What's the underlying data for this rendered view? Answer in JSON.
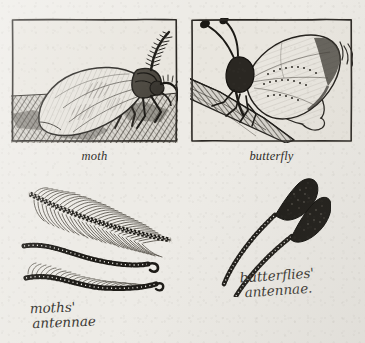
{
  "page": {
    "kind": "natural-history-plate",
    "paper_color": "#edebe6",
    "ink_color": "#2b2824"
  },
  "plates": [
    {
      "id": "moth",
      "caption": "moth",
      "scene": "moth resting on ground with folded wings and feathery antennae",
      "frame": {
        "x": 11,
        "y": 18,
        "width": 167,
        "height": 125
      }
    },
    {
      "id": "butterfly",
      "caption": "butterfly",
      "scene": "butterfly perched on a branch with wings raised and clubbed antennae",
      "frame": {
        "x": 190,
        "y": 18,
        "width": 163,
        "height": 125
      }
    }
  ],
  "diagrams": {
    "moths": {
      "label_line1": "moths'",
      "label_line2": "antennae",
      "specimens": [
        {
          "id": "plumose",
          "description": "broad feathery plumose antenna with beaded shaft"
        },
        {
          "id": "filiform",
          "description": "slender beaded filiform antenna with hooked tip"
        },
        {
          "id": "pectinate",
          "description": "beaded antenna with short comb bristles along one edge"
        }
      ]
    },
    "butterflies": {
      "label_line1": "butterflies'",
      "label_line2": "antennae.",
      "specimens": [
        {
          "id": "clubbed-upper",
          "description": "beaded shaft ending in a dark swollen club"
        },
        {
          "id": "clubbed-lower",
          "description": "beaded shaft ending in a dark swollen club"
        }
      ]
    }
  }
}
